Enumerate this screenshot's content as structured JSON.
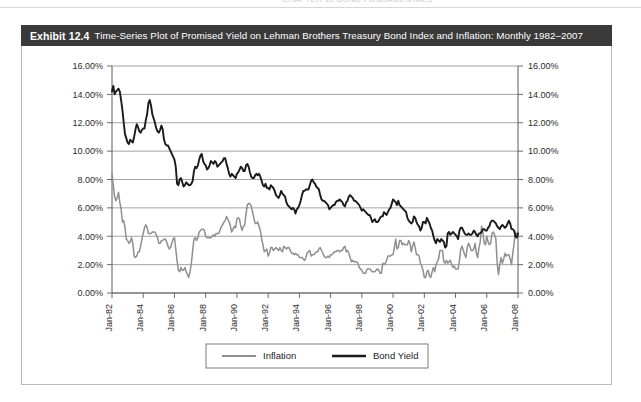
{
  "running_head": "CHAPTER 12  BOND FUNDAMENTALS",
  "exhibit": {
    "number": "Exhibit 12.4",
    "title": "Time-Series Plot of Promised Yield on Lehman Brothers Treasury Bond Index and Inflation: Monthly 1982–2007"
  },
  "colors": {
    "title_bar_bg": "#3a3a3a",
    "title_bar_text": "#ffffff",
    "frame_border": "#b9b9b9",
    "gridline": "#8c8c8c",
    "axis": "#5a5a5a",
    "inflation_line": "#8f8f8f",
    "bond_yield_line": "#1a1a1a",
    "plot_bg": "#ffffff"
  },
  "chart_data": {
    "type": "line",
    "title": "Time-Series Plot of Promised Yield on Lehman Brothers Treasury Bond Index and Inflation: Monthly 1982–2007",
    "xlabel": "",
    "ylabel": "",
    "ylim": [
      0,
      16
    ],
    "ytick_labels": [
      "16.00%",
      "14.00%",
      "12.00%",
      "10.00%",
      "8.00%",
      "6.00%",
      "4.00%",
      "2.00%",
      "0.00%"
    ],
    "ytick_values": [
      16,
      14,
      12,
      10,
      8,
      6,
      4,
      2,
      0
    ],
    "y_axis_right_labels": [
      "16.00%",
      "14.00%",
      "12.00%",
      "10.00%",
      "8.00%",
      "6.00%",
      "4.00%",
      "2.00%",
      "0.00%"
    ],
    "xtick_labels": [
      "Jan-82",
      "Jan-84",
      "Jan-86",
      "Jan-88",
      "Jan-90",
      "Jan-92",
      "Jan-94",
      "Jan-96",
      "Jan-98",
      "Jan-00",
      "Jan-02",
      "Jan-04",
      "Jan-06",
      "Jan-08"
    ],
    "x_start": "Jan-82",
    "x_end": "Jan-08",
    "x_frequency": "monthly",
    "grid": true,
    "grid_axis": "y",
    "legend_position": "bottom-center",
    "legend": [
      "Inflation",
      "Bond Yield"
    ],
    "series": [
      {
        "name": "Bond Yield",
        "color": "#1a1a1a",
        "values": [
          14.2,
          14.6,
          14.0,
          14.2,
          14.3,
          14.4,
          14.2,
          13.6,
          12.9,
          12.0,
          11.2,
          10.9,
          10.6,
          10.5,
          10.8,
          10.7,
          10.6,
          11.0,
          11.5,
          11.9,
          11.7,
          11.4,
          11.3,
          11.5,
          11.6,
          11.6,
          12.2,
          12.6,
          13.4,
          13.6,
          13.2,
          12.6,
          12.3,
          12.0,
          11.6,
          11.4,
          11.3,
          11.5,
          11.8,
          11.5,
          10.8,
          10.5,
          10.4,
          10.4,
          10.2,
          10.0,
          9.8,
          9.6,
          9.4,
          8.9,
          7.7,
          7.6,
          8.0,
          8.1,
          7.8,
          7.5,
          7.6,
          7.8,
          7.7,
          7.6,
          7.6,
          7.7,
          7.9,
          8.6,
          8.9,
          8.8,
          9.0,
          9.4,
          9.7,
          9.8,
          9.3,
          9.1,
          9.0,
          8.7,
          8.8,
          9.0,
          9.3,
          9.2,
          9.1,
          9.3,
          9.2,
          8.9,
          9.0,
          9.1,
          9.2,
          9.3,
          9.5,
          9.5,
          9.1,
          8.8,
          8.4,
          8.2,
          8.4,
          8.3,
          8.2,
          8.1,
          8.4,
          8.5,
          8.7,
          8.9,
          8.8,
          8.6,
          8.6,
          9.0,
          9.1,
          8.9,
          8.5,
          8.2,
          8.1,
          8.1,
          8.3,
          8.4,
          8.3,
          8.4,
          8.2,
          7.9,
          7.6,
          7.5,
          7.7,
          7.4,
          7.4,
          7.3,
          7.6,
          7.5,
          7.4,
          7.2,
          6.9,
          6.8,
          6.7,
          6.9,
          7.2,
          7.0,
          6.9,
          6.8,
          6.4,
          6.2,
          6.1,
          6.0,
          5.9,
          6.0,
          5.9,
          5.6,
          5.9,
          6.0,
          6.2,
          6.5,
          6.9,
          7.2,
          7.2,
          7.3,
          7.3,
          7.3,
          7.6,
          7.9,
          8.0,
          7.8,
          7.7,
          7.5,
          7.4,
          7.3,
          6.9,
          6.6,
          6.5,
          6.5,
          6.4,
          6.3,
          6.2,
          5.9,
          6.0,
          6.1,
          6.2,
          6.2,
          6.4,
          6.5,
          6.5,
          6.6,
          6.5,
          6.4,
          6.2,
          6.1,
          6.4,
          6.5,
          6.8,
          6.9,
          6.8,
          6.7,
          6.5,
          6.5,
          6.4,
          6.3,
          6.2,
          6.0,
          5.8,
          5.9,
          5.8,
          5.7,
          5.6,
          5.5,
          5.5,
          5.3,
          5.0,
          5.1,
          5.2,
          5.0,
          5.0,
          5.1,
          5.3,
          5.4,
          5.4,
          5.7,
          5.6,
          5.5,
          5.7,
          5.9,
          6.0,
          6.3,
          6.6,
          6.5,
          6.4,
          6.2,
          6.5,
          6.2,
          6.1,
          6.0,
          5.9,
          5.8,
          5.7,
          5.3,
          5.1,
          5.0,
          4.9,
          5.0,
          5.4,
          5.3,
          5.0,
          4.8,
          4.7,
          4.4,
          4.6,
          5.0,
          5.0,
          4.9,
          5.3,
          5.1,
          4.9,
          4.6,
          4.4,
          4.0,
          3.7,
          3.5,
          3.8,
          3.7,
          3.6,
          3.8,
          3.7,
          3.6,
          3.2,
          3.3,
          4.2,
          4.3,
          4.1,
          4.2,
          4.3,
          4.2,
          4.1,
          4.0,
          3.8,
          4.4,
          4.6,
          4.6,
          4.4,
          4.2,
          4.1,
          4.1,
          4.2,
          4.1,
          4.1,
          4.2,
          4.4,
          4.3,
          4.1,
          4.0,
          4.2,
          4.2,
          4.3,
          4.5,
          4.5,
          4.4,
          4.4,
          4.6,
          4.7,
          5.0,
          5.1,
          5.1,
          5.0,
          4.9,
          4.7,
          4.6,
          4.5,
          4.7,
          4.8,
          4.7,
          4.6,
          4.7,
          4.9,
          5.1,
          4.9,
          4.5,
          4.5,
          4.4,
          4.0,
          3.9,
          4.2
        ]
      },
      {
        "name": "Inflation",
        "color": "#8f8f8f",
        "values": [
          8.4,
          7.6,
          6.8,
          6.5,
          6.7,
          7.1,
          6.4,
          5.9,
          5.0,
          5.1,
          4.6,
          3.8,
          3.7,
          3.5,
          3.6,
          3.9,
          3.5,
          2.6,
          2.5,
          2.6,
          2.9,
          2.9,
          3.3,
          3.8,
          4.2,
          4.6,
          4.8,
          4.6,
          4.2,
          4.2,
          4.2,
          4.3,
          4.3,
          4.3,
          4.1,
          3.9,
          3.5,
          3.5,
          3.7,
          3.7,
          3.8,
          3.8,
          3.6,
          3.3,
          3.1,
          3.2,
          3.5,
          3.8,
          3.9,
          3.1,
          2.3,
          1.6,
          1.5,
          1.8,
          1.6,
          1.6,
          1.8,
          1.5,
          1.3,
          1.1,
          1.5,
          2.1,
          3.0,
          3.8,
          3.9,
          3.7,
          3.9,
          4.3,
          4.4,
          4.5,
          4.5,
          4.4,
          4.0,
          3.9,
          3.9,
          3.9,
          3.9,
          4.0,
          4.1,
          4.0,
          4.2,
          4.2,
          4.2,
          4.4,
          4.7,
          4.8,
          5.0,
          5.1,
          5.4,
          5.2,
          5.0,
          4.7,
          4.3,
          4.5,
          4.7,
          4.6,
          5.2,
          5.3,
          5.2,
          4.7,
          4.4,
          4.7,
          4.8,
          5.6,
          6.2,
          6.3,
          6.3,
          6.1,
          5.7,
          5.3,
          4.9,
          4.9,
          5.0,
          4.7,
          4.4,
          3.8,
          3.4,
          2.9,
          3.0,
          3.1,
          2.6,
          2.8,
          3.2,
          3.2,
          3.0,
          3.1,
          3.2,
          3.1,
          3.0,
          3.2,
          3.0,
          2.9,
          3.3,
          3.2,
          3.1,
          3.2,
          3.2,
          3.0,
          2.8,
          2.8,
          2.7,
          2.8,
          2.7,
          2.7,
          2.5,
          2.5,
          2.5,
          2.4,
          2.3,
          2.5,
          2.8,
          2.9,
          3.0,
          2.6,
          2.7,
          2.7,
          2.8,
          2.9,
          2.9,
          3.1,
          3.2,
          3.0,
          2.8,
          2.6,
          2.5,
          2.5,
          2.6,
          2.5,
          2.7,
          2.7,
          2.8,
          2.9,
          2.9,
          3.0,
          3.0,
          2.9,
          3.0,
          3.0,
          3.2,
          3.3,
          2.9,
          3.0,
          2.8,
          2.5,
          2.2,
          2.3,
          2.2,
          2.2,
          2.2,
          2.1,
          1.8,
          1.7,
          1.6,
          1.4,
          1.4,
          1.4,
          1.7,
          1.7,
          1.7,
          1.6,
          1.5,
          1.5,
          1.5,
          1.6,
          1.7,
          1.6,
          1.4,
          1.4,
          2.1,
          2.0,
          2.1,
          2.3,
          2.6,
          2.6,
          2.6,
          2.7,
          2.7,
          3.2,
          3.8,
          3.1,
          3.2,
          3.7,
          3.7,
          3.4,
          3.5,
          3.4,
          3.4,
          3.4,
          3.7,
          3.5,
          2.9,
          3.3,
          3.6,
          3.2,
          2.7,
          2.7,
          2.6,
          2.1,
          1.9,
          1.6,
          1.1,
          1.1,
          1.5,
          1.6,
          1.2,
          1.1,
          1.5,
          1.8,
          1.5,
          2.0,
          2.2,
          2.4,
          3.0,
          3.0,
          3.0,
          2.2,
          2.1,
          2.3,
          2.1,
          2.2,
          2.3,
          2.0,
          1.8,
          1.9,
          1.7,
          1.7,
          1.7,
          2.3,
          3.1,
          3.3,
          3.0,
          2.7,
          2.5,
          3.2,
          3.5,
          3.3,
          3.0,
          3.0,
          3.1,
          3.5,
          2.8,
          2.5,
          3.2,
          3.6,
          4.7,
          4.3,
          3.5,
          3.4,
          4.0,
          3.6,
          3.4,
          3.5,
          4.2,
          4.3,
          4.1,
          3.8,
          2.1,
          1.3,
          2.0,
          2.5,
          2.1,
          2.4,
          2.8,
          2.6,
          2.7,
          2.7,
          2.4,
          2.0,
          2.8,
          3.5,
          4.3,
          4.1,
          4.3
        ]
      }
    ]
  },
  "legend": {
    "items": [
      {
        "label": "Inflation",
        "color": "#8f8f8f"
      },
      {
        "label": "Bond Yield",
        "color": "#1a1a1a"
      }
    ]
  }
}
